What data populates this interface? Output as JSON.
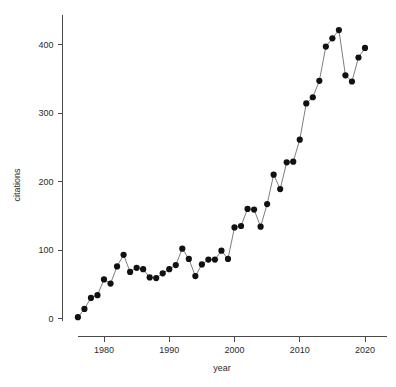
{
  "chart_data": {
    "type": "line",
    "title": "",
    "subtitle": "",
    "xlabel": "year",
    "ylabel": "citations",
    "xlim": [
      1975,
      2021
    ],
    "ylim": [
      -8,
      432
    ],
    "grid": false,
    "legend": null,
    "markers": "filled-circle",
    "x_ticks": [
      1980,
      1990,
      2000,
      2010,
      2020
    ],
    "x_tick_labels": [
      "1980",
      "1990",
      "2000",
      "2010",
      "2020"
    ],
    "y_ticks": [
      0,
      100,
      200,
      300,
      400
    ],
    "y_tick_labels": [
      "0",
      "100",
      "200",
      "300",
      "400"
    ],
    "x": [
      1976,
      1977,
      1978,
      1979,
      1980,
      1981,
      1982,
      1983,
      1984,
      1985,
      1986,
      1987,
      1988,
      1989,
      1990,
      1991,
      1992,
      1993,
      1994,
      1995,
      1996,
      1997,
      1998,
      1999,
      2000,
      2001,
      2002,
      2003,
      2004,
      2005,
      2006,
      2007,
      2008,
      2009,
      2010,
      2011,
      2012,
      2013,
      2014,
      2015,
      2016,
      2017,
      2018,
      2019,
      2020
    ],
    "values": [
      2,
      14,
      30,
      34,
      57,
      51,
      76,
      93,
      68,
      74,
      72,
      60,
      59,
      66,
      72,
      78,
      102,
      87,
      62,
      79,
      86,
      86,
      99,
      87,
      133,
      135,
      160,
      159,
      134,
      167,
      210,
      189,
      228,
      229,
      261,
      314,
      323,
      347,
      397,
      409,
      421,
      355,
      346,
      381,
      395
    ],
    "series": [
      {
        "name": "citations",
        "values": [
          2,
          14,
          30,
          34,
          57,
          51,
          76,
          93,
          68,
          74,
          72,
          60,
          59,
          66,
          72,
          78,
          102,
          87,
          62,
          79,
          86,
          86,
          99,
          87,
          133,
          135,
          160,
          159,
          134,
          167,
          210,
          189,
          228,
          229,
          261,
          314,
          323,
          347,
          397,
          409,
          421,
          355,
          346,
          381,
          395
        ],
        "color": "#111111",
        "line_color": "#6e6e6e"
      }
    ],
    "colors": {
      "point": "#111111",
      "line": "#6e6e6e",
      "axis": "#4a4a4a",
      "text": "#2b2b2b",
      "background": "#ffffff"
    }
  }
}
